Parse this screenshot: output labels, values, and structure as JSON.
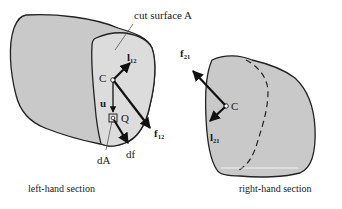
{
  "figure": {
    "colors": {
      "body_fill": "#c9c9c9",
      "cut_surface_fill": "#dcdcdc",
      "outline": "#222222",
      "arrow": "#111111",
      "background": "#ffffff"
    },
    "labels": {
      "cut_surface": "cut surface A",
      "left_section": "left-hand section",
      "right_section": "right-hand section",
      "centroid_left": "C",
      "centroid_right": "C",
      "point_q": "Q",
      "vector_u": "u",
      "area_element": "dA",
      "force_element": "df",
      "l12_main": "l",
      "l12_sub": "12",
      "f12_main": "f",
      "f12_sub": "12",
      "f21_main": "f",
      "f21_sub": "21",
      "l21_main": "l",
      "l21_sub": "21"
    }
  }
}
